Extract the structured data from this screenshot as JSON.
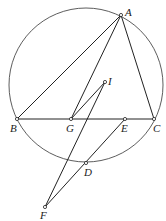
{
  "diagram": {
    "type": "geometry",
    "circle": {
      "cx": 86,
      "cy": 85,
      "r": 77
    },
    "points": [
      {
        "id": "A",
        "x": 121,
        "y": 15,
        "lx": 125,
        "ly": 16
      },
      {
        "id": "I",
        "x": 105,
        "y": 82,
        "lx": 108,
        "ly": 85
      },
      {
        "id": "B",
        "x": 17,
        "y": 119,
        "lx": 10,
        "ly": 132
      },
      {
        "id": "G",
        "x": 71,
        "y": 119,
        "lx": 66,
        "ly": 132
      },
      {
        "id": "E",
        "x": 125,
        "y": 119,
        "lx": 121,
        "ly": 132
      },
      {
        "id": "C",
        "x": 154,
        "y": 119,
        "lx": 153,
        "ly": 132
      },
      {
        "id": "D",
        "x": 86,
        "y": 163,
        "lx": 84,
        "ly": 176
      },
      {
        "id": "F",
        "x": 45,
        "y": 207,
        "lx": 40,
        "ly": 219
      }
    ]
  }
}
